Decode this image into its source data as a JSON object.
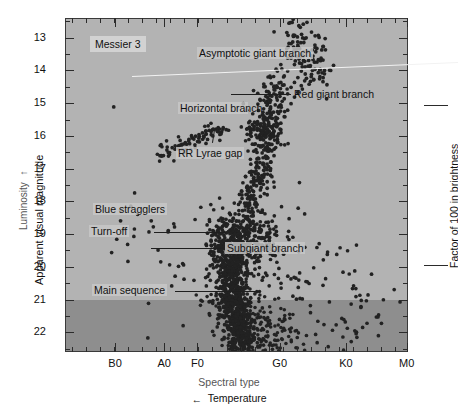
{
  "figure": {
    "name": "Messier 3 color-magnitude diagram",
    "background_color": "#ffffff",
    "plot_background_color": "#b3b3b3",
    "faint_band_color": "#8e8e8e"
  },
  "title_badge": {
    "label": "Messier 3"
  },
  "axes": {
    "y_left": {
      "title": "Apparent visual magnitude",
      "secondary_title": "Luminosity",
      "secondary_arrow": "↑",
      "ticks": [
        "13",
        "14",
        "15",
        "16",
        "17",
        "18",
        "19",
        "20",
        "21",
        "22"
      ],
      "range": [
        12.4,
        22.6
      ],
      "direction": "inverted"
    },
    "x_bottom": {
      "title": "Spectral type",
      "secondary_title": "Temperature",
      "secondary_arrow": "←",
      "ticks": [
        "B0",
        "A0",
        "F0",
        "G0",
        "K0",
        "M0"
      ]
    },
    "y_right": {
      "title": "Factor of 100 in brightness",
      "bracket_top_y": 105,
      "bracket_bottom_y": 265
    }
  },
  "annotations": [
    {
      "name": "asymptotic-giant-branch",
      "label": "Asymptotic giant branch"
    },
    {
      "name": "red-giant-branch",
      "label": "Red giant branch"
    },
    {
      "name": "horizontal-branch",
      "label": "Horizontal branch"
    },
    {
      "name": "rr-lyrae-gap",
      "label": "RR Lyrae gap"
    },
    {
      "name": "blue-stragglers",
      "label": "Blue stragglers"
    },
    {
      "name": "turn-off",
      "label": "Turn-off"
    },
    {
      "name": "subgiant-branch",
      "label": "Subgiant branch"
    },
    {
      "name": "main-sequence",
      "label": "Main sequence"
    }
  ],
  "chart_data": {
    "type": "scatter",
    "title": "Messier 3",
    "xlabel": "Spectral type",
    "ylabel": "Apparent visual magnitude",
    "xlim": [
      0,
      100
    ],
    "ylim": [
      12.4,
      22.6
    ],
    "y_inverted": true,
    "grid": false,
    "legend": null,
    "x_tick_labels": [
      "B0",
      "A0",
      "F0",
      "G0",
      "K0",
      "M0"
    ],
    "x_tick_positions": [
      14.6,
      28.9,
      38.6,
      62.6,
      81.9,
      99.6
    ],
    "y_tick_labels": [
      "13",
      "14",
      "15",
      "16",
      "17",
      "18",
      "19",
      "20",
      "21",
      "22"
    ],
    "y_tick_values": [
      13,
      14,
      15,
      16,
      17,
      18,
      19,
      20,
      21,
      22
    ],
    "annotations_text": [
      "Messier 3",
      "Asymptotic giant branch",
      "Red giant branch",
      "Horizontal branch",
      "RR Lyrae gap",
      "Blue stragglers",
      "Turn-off",
      "Subgiant branch",
      "Main sequence",
      "Luminosity",
      "Factor of 100 in brightness",
      "Temperature",
      "Spectral type"
    ],
    "series": [
      {
        "name": "Red giant branch",
        "marker_color": "#222222",
        "points_xy": [
          [
            72,
            12.8
          ],
          [
            74,
            12.9
          ],
          [
            70,
            13.0
          ],
          [
            76,
            13.0
          ],
          [
            68,
            13.2
          ],
          [
            73,
            13.2
          ],
          [
            71,
            13.4
          ],
          [
            75,
            13.35
          ],
          [
            69,
            13.5
          ],
          [
            72,
            13.55
          ],
          [
            66,
            13.6
          ],
          [
            70,
            13.7
          ],
          [
            74,
            13.65
          ],
          [
            67,
            13.8
          ],
          [
            71,
            13.85
          ],
          [
            65,
            14.0
          ],
          [
            69,
            14.0
          ],
          [
            73,
            13.95
          ],
          [
            64,
            14.15
          ],
          [
            68,
            14.2
          ],
          [
            72,
            14.1
          ],
          [
            63,
            14.35
          ],
          [
            67,
            14.35
          ],
          [
            70,
            14.3
          ],
          [
            62,
            14.5
          ],
          [
            66,
            14.5
          ],
          [
            69,
            14.45
          ],
          [
            61,
            14.7
          ],
          [
            65,
            14.7
          ],
          [
            68,
            14.65
          ],
          [
            60,
            14.9
          ],
          [
            64,
            14.85
          ],
          [
            67,
            14.8
          ],
          [
            60,
            15.1
          ],
          [
            63,
            15.05
          ],
          [
            66,
            15.0
          ],
          [
            59,
            15.3
          ],
          [
            62,
            15.25
          ],
          [
            65,
            15.2
          ],
          [
            59,
            15.5
          ],
          [
            62,
            15.45
          ],
          [
            64,
            15.4
          ],
          [
            58,
            15.7
          ],
          [
            61,
            15.65
          ],
          [
            63,
            15.6
          ],
          [
            58,
            15.9
          ],
          [
            61,
            15.85
          ],
          [
            63,
            15.8
          ],
          [
            57,
            16.1
          ],
          [
            60,
            16.05
          ],
          [
            62,
            16.0
          ],
          [
            57,
            16.3
          ],
          [
            60,
            16.25
          ],
          [
            62,
            16.2
          ],
          [
            56,
            16.5
          ],
          [
            59,
            16.45
          ],
          [
            61,
            16.4
          ],
          [
            56,
            16.7
          ],
          [
            59,
            16.65
          ],
          [
            61,
            16.6
          ],
          [
            56,
            16.9
          ],
          [
            58,
            16.85
          ],
          [
            60,
            16.8
          ],
          [
            55,
            17.1
          ],
          [
            58,
            17.05
          ],
          [
            60,
            17.0
          ],
          [
            55,
            17.3
          ],
          [
            58,
            17.25
          ],
          [
            60,
            17.2
          ],
          [
            55,
            17.5
          ],
          [
            57,
            17.45
          ],
          [
            59,
            17.4
          ],
          [
            55,
            17.7
          ],
          [
            57,
            17.65
          ],
          [
            59,
            17.6
          ],
          [
            54,
            17.9
          ],
          [
            57,
            17.85
          ],
          [
            59,
            17.8
          ]
        ]
      },
      {
        "name": "Horizontal branch",
        "marker_color": "#222222",
        "points_xy": [
          [
            28,
            16.6
          ],
          [
            30,
            16.5
          ],
          [
            32,
            16.4
          ],
          [
            33,
            16.3
          ],
          [
            35,
            16.2
          ],
          [
            36,
            16.15
          ],
          [
            37,
            16.05
          ],
          [
            38,
            16.0
          ],
          [
            39,
            15.95
          ],
          [
            40,
            15.9
          ],
          [
            41,
            15.85
          ],
          [
            42,
            15.82
          ],
          [
            43,
            15.8
          ],
          [
            44,
            15.78
          ],
          [
            45,
            15.78
          ],
          [
            46,
            15.78
          ],
          [
            47,
            15.8
          ],
          [
            53,
            15.78
          ],
          [
            54,
            15.78
          ],
          [
            55,
            15.8
          ],
          [
            56,
            15.8
          ],
          [
            57,
            15.82
          ],
          [
            58,
            15.85
          ],
          [
            59,
            15.9
          ],
          [
            60,
            15.95
          ],
          [
            61,
            16.0
          ],
          [
            62,
            16.1
          ]
        ]
      },
      {
        "name": "Asymptotic giant branch",
        "marker_color": "#222222",
        "points_xy": [
          [
            58,
            14.4
          ],
          [
            60,
            14.2
          ],
          [
            62,
            14.0
          ],
          [
            63,
            13.8
          ],
          [
            65,
            13.6
          ],
          [
            67,
            13.4
          ],
          [
            55,
            14.6
          ],
          [
            57,
            14.9
          ],
          [
            53,
            15.2
          ],
          [
            52,
            15.0
          ]
        ]
      },
      {
        "name": "Subgiant branch",
        "marker_color": "#222222",
        "points_xy": [
          [
            48,
            18.6
          ],
          [
            50,
            18.6
          ],
          [
            52,
            18.6
          ],
          [
            54,
            18.65
          ],
          [
            56,
            18.7
          ],
          [
            58,
            18.75
          ],
          [
            49,
            18.8
          ],
          [
            51,
            18.8
          ],
          [
            53,
            18.85
          ],
          [
            55,
            18.9
          ],
          [
            57,
            18.95
          ],
          [
            59,
            19.0
          ]
        ]
      },
      {
        "name": "Main sequence",
        "marker_color": "#222222",
        "points_xy": [
          [
            46,
            19.2
          ],
          [
            47,
            19.5
          ],
          [
            47,
            19.8
          ],
          [
            48,
            20.1
          ],
          [
            48,
            20.4
          ],
          [
            49,
            20.7
          ],
          [
            49,
            21.0
          ],
          [
            50,
            21.3
          ],
          [
            50,
            21.6
          ],
          [
            51,
            21.9
          ],
          [
            51,
            22.2
          ],
          [
            45,
            19.4
          ],
          [
            46,
            19.9
          ],
          [
            46,
            20.3
          ],
          [
            47,
            20.8
          ],
          [
            47,
            21.2
          ],
          [
            48,
            21.7
          ],
          [
            44,
            20.9
          ],
          [
            45,
            21.5
          ],
          [
            43,
            22.0
          ]
        ]
      },
      {
        "name": "Blue stragglers",
        "marker_color": "#222222",
        "points_xy": [
          [
            19,
            18.15
          ],
          [
            14,
            15.1
          ],
          [
            21,
            18.4
          ],
          [
            25,
            18.6
          ],
          [
            30,
            18.9
          ],
          [
            27,
            19.5
          ],
          [
            33,
            20.0
          ],
          [
            32,
            20.3
          ],
          [
            31,
            20.6
          ],
          [
            24,
            22.2
          ],
          [
            16,
            18.6
          ]
        ]
      }
    ]
  }
}
